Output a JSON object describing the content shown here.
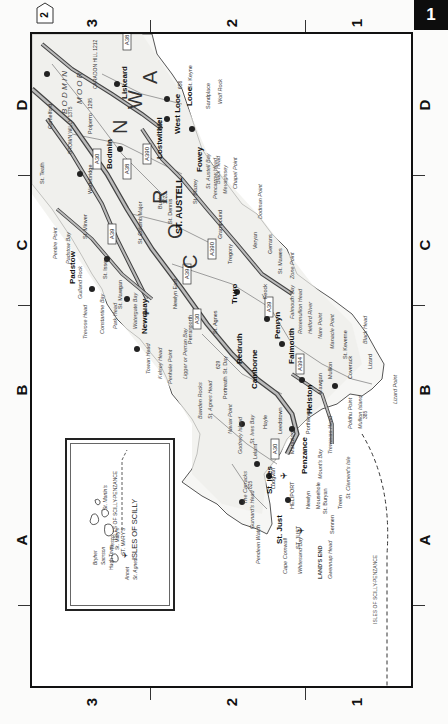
{
  "page": {
    "page_number": "1",
    "prev_page_tab": "2"
  },
  "grid": {
    "columns": [
      "D",
      "C",
      "B",
      "A"
    ],
    "rows": [
      "3",
      "2",
      "1"
    ]
  },
  "map": {
    "region_labels": [
      "C",
      "O",
      "R",
      "N",
      "W",
      "A",
      "L",
      "L"
    ],
    "moor_label": [
      "B",
      "O",
      "D",
      "M",
      "I",
      "N",
      "M",
      "O",
      "O",
      "R"
    ],
    "towns_major": [
      {
        "name": "ST. AUSTELL"
      },
      {
        "name": "Bodmin"
      },
      {
        "name": "Liskeard"
      },
      {
        "name": "Lostwithiel"
      },
      {
        "name": "West Looe"
      },
      {
        "name": "Looe"
      },
      {
        "name": "Fowey"
      },
      {
        "name": "Padstow"
      },
      {
        "name": "Newquay"
      },
      {
        "name": "Truro"
      },
      {
        "name": "Redruth"
      },
      {
        "name": "Camborne"
      },
      {
        "name": "Falmouth"
      },
      {
        "name": "Penryn"
      },
      {
        "name": "Helston"
      },
      {
        "name": "Penzance"
      },
      {
        "name": "St. Ives"
      },
      {
        "name": "St. Just"
      }
    ],
    "places_minor": [
      "Camelford",
      "Wadebridge",
      "St. Teath",
      "Port Isaac",
      "Port Isaac Bay",
      "St. Minver",
      "St. Issey",
      "St. Columb Major",
      "St. Mawgan",
      "ST. MAWGAN",
      "Bugle",
      "St. Dennis",
      "St. Blazey",
      "Grampound",
      "Tregony",
      "Veryan",
      "Veryan Bay",
      "Gerrans",
      "St. Mawes",
      "Feock",
      "St. Day",
      "St. Agnes",
      "Perranporth",
      "Portreath",
      "Newlyn East",
      "Leedstown",
      "Marazion",
      "Hayle",
      "Lelant",
      "Ludgvan",
      "Newlyn",
      "Mousehole",
      "St. Buryan",
      "Treen",
      "Sennen",
      "ST. JUST",
      "HELIPORT",
      "Mawgan",
      "Mullion",
      "Coverack",
      "St. Keverne",
      "Cadgwith",
      "Lizard",
      "Porthleven",
      "Lanreath",
      "St. Neot",
      "Polperro",
      "Sandplace",
      "St. Keyne",
      "Par",
      "Polkerris"
    ],
    "coastal_features": [
      "Pentire Point",
      "Padstow Bay",
      "Gulland Rock",
      "Trevose Head",
      "Constantine Bay",
      "Park Head",
      "Watergate Bay",
      "Towan Head",
      "Kelsey Head",
      "Penhale Point",
      "Ligger or Perran Bay",
      "Bawden Rocks",
      "St. Agnes Head",
      "Navax Point",
      "Godrevy Island",
      "St. Ives Bay",
      "The Carracks",
      "Gurnard's Head",
      "Pendeen Watch",
      "Cape Cornwall",
      "Whitesand Bay",
      "LAND'S END",
      "Gwennap Head",
      "St. Clement's Isle",
      "Mount's Bay",
      "Trewavas Head",
      "Predannack Head",
      "Mullion Island",
      "Poldhu Point",
      "Lizard Point",
      "Black Head",
      "Manacle Point",
      "Nare Point",
      "Helford River",
      "Rosemullion Head",
      "Falmouth Bay",
      "Zone Point",
      "Dodman Point",
      "Chapel Point",
      "Mevagissey",
      "Black Head",
      "Gribbin Head",
      "St. Austell Bay",
      "Pencarrow Head",
      "Looe Island",
      "Wolf Rock"
    ],
    "heights": [
      {
        "label": "BROWN WILLY 1375",
        "value": "1375"
      },
      {
        "label": "CARADON HILL 1212",
        "value": "1212"
      },
      {
        "label": "1295",
        "value": "1295"
      },
      {
        "label": "888",
        "value": "888"
      },
      {
        "label": "656",
        "value": "656"
      },
      {
        "label": "1023",
        "value": "1023"
      },
      {
        "label": "629",
        "value": "629"
      },
      {
        "label": "825",
        "value": "825"
      },
      {
        "label": "385",
        "value": "385"
      }
    ],
    "road_shields": [
      "A30",
      "A38",
      "A390",
      "A39",
      "A3083",
      "A394",
      "A30",
      "A38",
      "A390",
      "A39",
      "A30"
    ],
    "road_numbers": [
      "12",
      "13",
      "17",
      "18",
      "16",
      "9",
      "8",
      "10",
      "11",
      "4",
      "7"
    ],
    "ferry_route_label": "ISLES OF SCILLY-PENZANCE",
    "ferry_route_label_short": "ISLES OF SCILLY-PENZANCE"
  },
  "inset": {
    "title": "ISLES OF SCILLY",
    "islands": [
      "St. Martin's",
      "Tresco",
      "Bryher",
      "Samson",
      "Hugh Town",
      "St. Mary's",
      "Annet",
      "St. Agnes"
    ],
    "airport_label": "ST. MARY'S",
    "ferry_label": "ISLES OF SCILLY-PENZANCE"
  }
}
